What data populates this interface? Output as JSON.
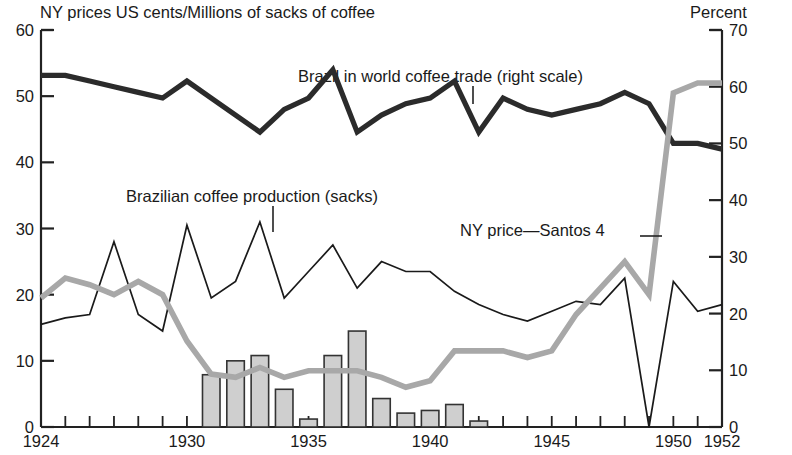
{
  "header": {
    "left_title": "NY prices US cents/Millions of sacks of coffee",
    "right_title": "Percent"
  },
  "annotations": {
    "trade": "Brazil in world coffee trade (right scale)",
    "production": "Brazilian coffee production (sacks)",
    "ny_price": "NY price—Santos 4"
  },
  "axes": {
    "left_ticks": [
      "0",
      "10",
      "20",
      "30",
      "40",
      "50",
      "60"
    ],
    "right_ticks": [
      "0",
      "10",
      "20",
      "30",
      "40",
      "50",
      "60",
      "70"
    ],
    "x_ticks": [
      "1924",
      "1930",
      "1935",
      "1940",
      "1945",
      "1950",
      "1952"
    ]
  },
  "chart_data": {
    "type": "line",
    "title": "NY prices US cents/Millions of sacks of coffee",
    "xlabel": "",
    "ylabel": "NY prices US cents/Millions of sacks of coffee",
    "ylabel_right": "Percent",
    "ylim": [
      0,
      60
    ],
    "ylim_right": [
      0,
      70
    ],
    "xlim": [
      1924,
      1952
    ],
    "grid": false,
    "legend": "annotated inline",
    "x": [
      1924,
      1925,
      1926,
      1927,
      1928,
      1929,
      1930,
      1931,
      1932,
      1933,
      1934,
      1935,
      1936,
      1937,
      1938,
      1939,
      1940,
      1941,
      1942,
      1943,
      1944,
      1945,
      1946,
      1947,
      1948,
      1949,
      1950,
      1951,
      1952
    ],
    "series": [
      {
        "name": "Brazil in world coffee trade (right scale)",
        "axis": "right",
        "units": "percent",
        "style": "thick-black",
        "color": "#2b2b2b",
        "values": [
          62,
          62,
          61,
          60,
          59,
          58,
          61,
          58,
          55,
          52,
          56,
          58,
          63,
          52,
          55,
          57,
          58,
          61,
          52,
          58,
          56,
          55,
          56,
          57,
          59,
          57,
          50,
          50,
          49
        ]
      },
      {
        "name": "Brazilian coffee production (sacks)",
        "axis": "left",
        "units": "millions of sacks",
        "style": "thin-black",
        "color": "#1a1a1a",
        "values": [
          15.5,
          16.5,
          17.0,
          28.0,
          17.0,
          14.5,
          30.5,
          19.5,
          22.0,
          31.0,
          19.5,
          23.5,
          27.5,
          21.0,
          25.0,
          23.5,
          23.5,
          20.5,
          18.5,
          17.0,
          16.0,
          17.5,
          19.0,
          18.5,
          22.5,
          0,
          22.0,
          17.5,
          18.5
        ]
      },
      {
        "name": "NY price—Santos 4",
        "axis": "left",
        "units": "US cents",
        "style": "thick-gray",
        "color": "#a8a8a8",
        "values": [
          19.5,
          22.5,
          21.5,
          20.0,
          22.0,
          20.0,
          13.0,
          8.0,
          7.5,
          9.0,
          7.5,
          8.5,
          8.5,
          8.5,
          7.5,
          6.0,
          7.0,
          11.5,
          11.5,
          11.5,
          10.5,
          11.5,
          17.0,
          21.0,
          25.0,
          20.0,
          50.5,
          52.0,
          52.0
        ]
      }
    ],
    "bars": {
      "name": "Brazilian coffee destroyed / withheld (sacks)",
      "axis": "left",
      "units": "millions of sacks",
      "color": "#cfcfcf",
      "edge": "#333333",
      "x": [
        1931,
        1932,
        1933,
        1934,
        1935,
        1936,
        1937,
        1938,
        1939,
        1940,
        1941,
        1942
      ],
      "values": [
        7.9,
        10.0,
        10.8,
        5.7,
        1.2,
        10.8,
        14.5,
        4.3,
        2.1,
        2.5,
        3.4,
        0.9
      ]
    }
  }
}
